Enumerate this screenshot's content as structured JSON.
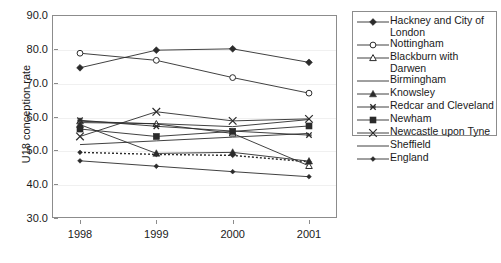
{
  "chart_data": {
    "type": "line",
    "title": "",
    "xlabel": "",
    "ylabel": "U18 conception rate",
    "categories": [
      "1998",
      "1999",
      "2000",
      "2001"
    ],
    "x": [
      1998,
      1999,
      2000,
      2001
    ],
    "ylim": [
      30.0,
      90.0
    ],
    "ytick_labels": [
      "90.0",
      "80.0",
      "70.0",
      "60.0",
      "50.0",
      "40.0",
      "30.0"
    ],
    "ytick_values": [
      90.0,
      80.0,
      70.0,
      60.0,
      50.0,
      40.0,
      30.0
    ],
    "grid": true,
    "legend_position": "right",
    "series": [
      {
        "name": "Hackney and City of London",
        "marker": "filled-diamond",
        "line": "solid",
        "values": [
          74.4,
          79.6,
          80.0,
          76.0
        ]
      },
      {
        "name": "Nottingham",
        "marker": "open-circle",
        "line": "solid",
        "values": [
          78.7,
          76.6,
          71.5,
          66.9
        ]
      },
      {
        "name": "Blackburn with Darwen",
        "marker": "open-triangle",
        "line": "solid",
        "values": [
          58.6,
          57.8,
          55.0,
          45.4
        ]
      },
      {
        "name": "Birmingham",
        "marker": "none",
        "line": "solid",
        "values": [
          58.2,
          57.9,
          57.0,
          59.1
        ]
      },
      {
        "name": "Knowsley",
        "marker": "filled-triangle",
        "line": "solid",
        "values": [
          57.6,
          49.1,
          49.4,
          46.8
        ]
      },
      {
        "name": "Redcar and Cleveland",
        "marker": "small-x",
        "line": "solid",
        "values": [
          58.9,
          57.1,
          55.7,
          54.5
        ]
      },
      {
        "name": "Newham",
        "marker": "filled-square",
        "line": "solid",
        "values": [
          56.3,
          54.1,
          55.6,
          57.2
        ]
      },
      {
        "name": "Newcastle upon Tyne",
        "marker": "large-x",
        "line": "solid",
        "values": [
          54.1,
          61.4,
          58.7,
          59.3
        ]
      },
      {
        "name": "Sheffield",
        "marker": "none",
        "line": "solid",
        "values": [
          51.7,
          52.8,
          53.9,
          55.0
        ]
      },
      {
        "name": "England",
        "marker": "small-diamond",
        "line": "dotted",
        "values": [
          49.4,
          48.8,
          48.5,
          46.6
        ]
      }
    ],
    "extra_series": [
      {
        "name": "unlabelled-lower",
        "marker": "small-diamond",
        "line": "solid",
        "values": [
          46.9,
          45.3,
          43.7,
          42.2
        ]
      }
    ]
  },
  "legend": {
    "items": [
      {
        "label": "Hackney and City of London",
        "key": "filled-diamond-key"
      },
      {
        "label": "Nottingham",
        "key": "open-circle-key"
      },
      {
        "label": "Blackburn with Darwen",
        "key": "open-triangle-key"
      },
      {
        "label": "Birmingham",
        "key": "plain-line-key"
      },
      {
        "label": "Knowsley",
        "key": "filled-triangle-key"
      },
      {
        "label": "Redcar and Cleveland",
        "key": "small-x-key"
      },
      {
        "label": "Newham",
        "key": "filled-square-key"
      },
      {
        "label": "Newcastle upon Tyne",
        "key": "large-x-key"
      },
      {
        "label": "Sheffield",
        "key": "plain-line-key"
      },
      {
        "label": "England",
        "key": "small-diamond-key"
      }
    ]
  },
  "colors": {
    "line": "#2b2b2b",
    "axis": "#8c8c8c",
    "grid": "#f0f0f0",
    "text": "#1a1a1a",
    "background": "#ffffff"
  }
}
